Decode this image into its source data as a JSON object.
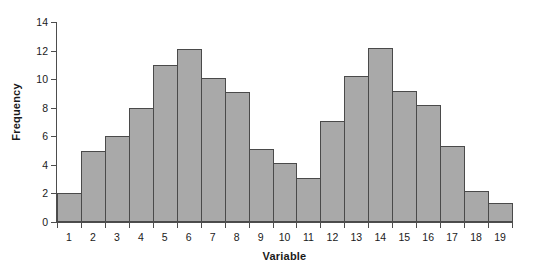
{
  "chart_data": {
    "type": "bar",
    "title": "",
    "subtitle": "",
    "xlabel": "Variable",
    "ylabel": "Frequency",
    "categories": [
      "1",
      "2",
      "3",
      "4",
      "5",
      "6",
      "7",
      "8",
      "9",
      "10",
      "11",
      "12",
      "13",
      "14",
      "15",
      "16",
      "17",
      "18",
      "19"
    ],
    "values": [
      2.0,
      5.0,
      6.0,
      8.0,
      11.0,
      12.1,
      10.1,
      9.1,
      5.1,
      4.1,
      3.1,
      7.1,
      10.2,
      12.2,
      9.2,
      8.2,
      5.3,
      2.2,
      1.3
    ],
    "xlim": [
      0.5,
      19.5
    ],
    "ylim": [
      0,
      14
    ],
    "ytick_values": [
      0,
      2,
      4,
      6,
      8,
      10,
      12,
      14
    ],
    "ytick_labels": [
      "0",
      "2",
      "4",
      "6",
      "8",
      "10",
      "12",
      "14"
    ],
    "xtick_labels": [
      "1",
      "2",
      "3",
      "4",
      "5",
      "6",
      "7",
      "8",
      "9",
      "10",
      "11",
      "12",
      "13",
      "14",
      "15",
      "16",
      "17",
      "18",
      "19"
    ],
    "grid": false,
    "legend": null,
    "bar_fill_color": "#a9a9a9",
    "bar_edge_color": "#4a4a4a",
    "axis_color": "#4d4d4d",
    "background_color": "#ffffff",
    "bar_width_fraction": 1.0
  },
  "axes": {
    "y_title": "Frequency",
    "x_title": "Variable"
  }
}
